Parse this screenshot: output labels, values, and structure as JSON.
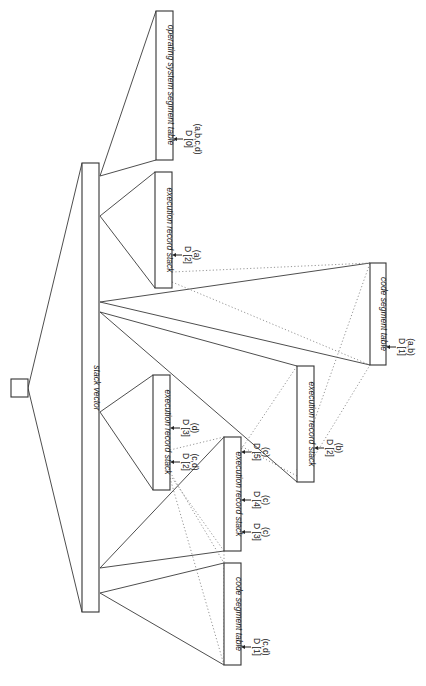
{
  "diagram": {
    "orientation": "rotated-90-clockwise",
    "root": {
      "label": ""
    },
    "stack_vector": {
      "label": "stack vector"
    },
    "boxes": [
      {
        "id": "os-segment-table",
        "label": "operating system segment table",
        "pointers": [
          {
            "d": "D [0]",
            "tasks": "(a,b,c,d)"
          }
        ]
      },
      {
        "id": "exec-stack-a",
        "label": "execution record stack",
        "pointers": [
          {
            "d": "D [2]",
            "tasks": "(a)"
          }
        ]
      },
      {
        "id": "code-segment-table-ab",
        "label": "code segment table",
        "pointers": [
          {
            "d": "D [1]",
            "tasks": "(a,b)"
          }
        ]
      },
      {
        "id": "exec-stack-b",
        "label": "execution record stack",
        "pointers": [
          {
            "d": "D [2]",
            "tasks": "(b)"
          }
        ]
      },
      {
        "id": "exec-stack-d",
        "label": "execution record stack",
        "pointers": [
          {
            "d": "D [3]",
            "tasks": "(d)"
          },
          {
            "d": "D [2]",
            "tasks": "(c,d)"
          }
        ]
      },
      {
        "id": "exec-stack-c",
        "label": "execution record stack",
        "pointers": [
          {
            "d": "D [5]",
            "tasks": "(c)"
          },
          {
            "d": "D [4]",
            "tasks": "(c)"
          },
          {
            "d": "D [3]",
            "tasks": "(c)"
          }
        ]
      },
      {
        "id": "code-segment-table-cd",
        "label": "code segment table",
        "pointers": [
          {
            "d": "D [1]",
            "tasks": "(c,d)"
          }
        ]
      }
    ],
    "colors": {
      "line": "#3a3a3a",
      "dotted": "#8a8a8a",
      "background": "#ffffff"
    }
  }
}
